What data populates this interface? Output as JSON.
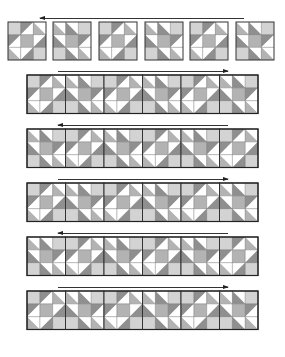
{
  "colors": {
    "light": "#d3d3d3",
    "medium": "#b3b3b3",
    "dark": "#8f8f8f",
    "white": "#ffffff",
    "line": "#333333"
  },
  "block_row": {
    "arrow_direction": "left",
    "block_count": 6,
    "block_size": 38,
    "block_x": [
      8,
      53,
      99,
      145,
      190,
      236
    ],
    "y": 22,
    "arrow": {
      "x": 40,
      "y": 18,
      "width": 204
    }
  },
  "strips": [
    {
      "y": 75,
      "arrow_direction": "right",
      "arrow": {
        "x": 58,
        "y": 71,
        "width": 170
      }
    },
    {
      "y": 129,
      "arrow_direction": "left",
      "arrow": {
        "x": 58,
        "y": 125,
        "width": 170
      }
    },
    {
      "y": 183,
      "arrow_direction": "right",
      "arrow": {
        "x": 58,
        "y": 179,
        "width": 170
      }
    },
    {
      "y": 237,
      "arrow_direction": "left",
      "arrow": {
        "x": 58,
        "y": 233,
        "width": 170
      }
    },
    {
      "y": 291,
      "arrow_direction": "right",
      "arrow": {
        "x": 58,
        "y": 287,
        "width": 170
      }
    }
  ],
  "strip_layout": {
    "x": 27,
    "block_size": 38.5,
    "block_count": 6
  }
}
